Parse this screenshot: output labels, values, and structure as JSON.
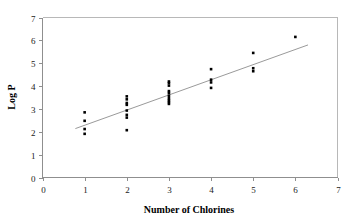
{
  "chart_data": {
    "type": "scatter",
    "title": "",
    "xlabel": "Number of Chlorines",
    "ylabel": "Log P",
    "xlim": [
      0,
      7
    ],
    "ylim": [
      0,
      7
    ],
    "xticks": [
      0,
      1,
      2,
      3,
      4,
      5,
      6,
      7
    ],
    "yticks": [
      0,
      1,
      2,
      3,
      4,
      5,
      6,
      7
    ],
    "xtick_labels": [
      "0",
      "1",
      "2",
      "3",
      "4",
      "5",
      "6",
      "7"
    ],
    "ytick_labels": [
      "0",
      "1",
      "2",
      "3",
      "4",
      "5",
      "6",
      "7"
    ],
    "grid": false,
    "legend": false,
    "legend_position": "none",
    "marker": "filled-square",
    "marker_color": "#000000",
    "points": [
      {
        "x": 1,
        "y": 2.85
      },
      {
        "x": 1,
        "y": 2.48
      },
      {
        "x": 1,
        "y": 2.12
      },
      {
        "x": 1,
        "y": 1.91
      },
      {
        "x": 2,
        "y": 3.55
      },
      {
        "x": 2,
        "y": 3.42
      },
      {
        "x": 2,
        "y": 3.26
      },
      {
        "x": 2,
        "y": 3.18
      },
      {
        "x": 2,
        "y": 2.93
      },
      {
        "x": 2,
        "y": 2.74
      },
      {
        "x": 2,
        "y": 2.62
      },
      {
        "x": 2,
        "y": 2.07
      },
      {
        "x": 3,
        "y": 4.2
      },
      {
        "x": 3,
        "y": 4.13
      },
      {
        "x": 3,
        "y": 4.02
      },
      {
        "x": 3,
        "y": 3.78
      },
      {
        "x": 3,
        "y": 3.7
      },
      {
        "x": 3,
        "y": 3.58
      },
      {
        "x": 3,
        "y": 3.47
      },
      {
        "x": 3,
        "y": 3.38
      },
      {
        "x": 3,
        "y": 3.3
      },
      {
        "x": 3,
        "y": 3.22
      },
      {
        "x": 4,
        "y": 4.74
      },
      {
        "x": 4,
        "y": 4.28
      },
      {
        "x": 4,
        "y": 4.16
      },
      {
        "x": 4,
        "y": 3.92
      },
      {
        "x": 5,
        "y": 5.45
      },
      {
        "x": 5,
        "y": 4.78
      },
      {
        "x": 5,
        "y": 4.65
      },
      {
        "x": 6,
        "y": 6.15
      }
    ],
    "trend_line": {
      "type": "linear-fit",
      "x_start": 0.78,
      "y_start": 2.14,
      "x_end": 6.3,
      "y_end": 5.8,
      "color": "#9a9a9a"
    },
    "colors": {
      "marker": "#000000",
      "trend": "#9a9a9a",
      "axis": "#8f8f8f",
      "frame": "#b8b8b8",
      "text": "#000000",
      "background": "#ffffff"
    }
  }
}
